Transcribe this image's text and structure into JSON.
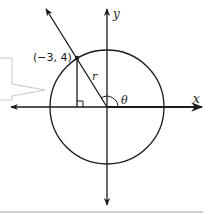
{
  "diagram": {
    "type": "unit-circle-angle",
    "point_label": "(−3, 4)",
    "radius_label": "r",
    "angle_label": "θ",
    "x_axis_label": "x",
    "y_axis_label": "y",
    "point": {
      "x": -3,
      "y": 4
    },
    "colors": {
      "stroke": "#1a1a1a",
      "callout": "#c8c8c8",
      "bottom_rule": "#d0d0d0"
    }
  }
}
